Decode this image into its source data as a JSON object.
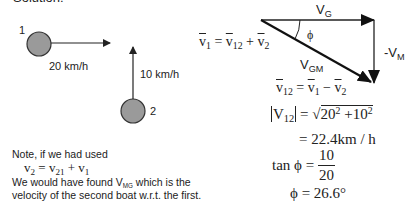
{
  "heading": "Solution:",
  "boats": [
    {
      "label": "1",
      "speed_label": "20 km/h",
      "direction": "east"
    },
    {
      "label": "2",
      "speed_label": "10 km/h",
      "direction": "north"
    }
  ],
  "vector_triangle": {
    "top_label_main": "V",
    "top_label_sub": "G",
    "side_label_main": "-V",
    "side_label_sub": "M",
    "hyp_label_main": "V",
    "hyp_label_sub": "GM",
    "angle_label": "ϕ"
  },
  "equations": {
    "eq1": {
      "a": "v",
      "a_sub": "1",
      "eq": " = ",
      "b": "v",
      "b_sub": "12",
      "plus": " + ",
      "c": "v",
      "c_sub": "2"
    },
    "eq2": {
      "a": "v",
      "a_sub": "12",
      "eq": " = ",
      "b": "v",
      "b_sub": "1",
      "minus": " − ",
      "c": "v",
      "c_sub": "2"
    },
    "magnitude": {
      "lhs": "V",
      "lhs_sub": "12",
      "eq": " = ",
      "radical": "√",
      "term1": "20",
      "exp1": "2",
      "plus": " +",
      "term2": "10",
      "exp2": "2"
    },
    "result": "= 22.4km / h",
    "tan": {
      "lhs": "tan ϕ = ",
      "numerator": "10",
      "denominator": "20"
    },
    "angle": "ϕ = 26.6°"
  },
  "note": {
    "line1": "Note, if we had used",
    "eq": {
      "a": "v",
      "a_sub": "2",
      "eq": " = ",
      "b": "v",
      "b_sub": "21",
      "plus": " + ",
      "c": "v",
      "c_sub": "1"
    },
    "line2_pre": "We would have found V",
    "line2_sub": "MG",
    "line2_post": " which is the",
    "line3": "velocity of the second boat w.r.t. the first."
  },
  "colors": {
    "boat_fill": "#9a9a9a",
    "stroke": "#222222",
    "text": "#222222"
  }
}
